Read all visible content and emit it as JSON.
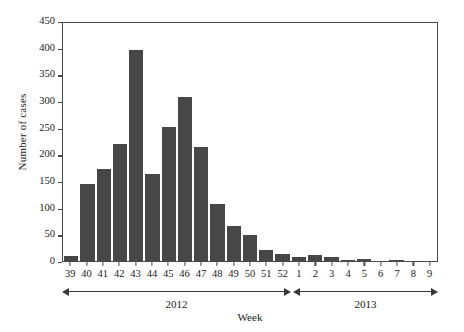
{
  "chart_data": {
    "type": "bar",
    "title": "",
    "xlabel": "Week",
    "ylabel": "Number of cases",
    "ylim": [
      0,
      450
    ],
    "ytick_values": [
      0,
      50,
      100,
      150,
      200,
      250,
      300,
      350,
      400,
      450
    ],
    "ytick_labels": [
      "0",
      "50",
      "100",
      "150",
      "200",
      "250",
      "300",
      "350",
      "400",
      "450"
    ],
    "grid": false,
    "legend": null,
    "bar_color": "#474747",
    "categories": [
      "39",
      "40",
      "41",
      "42",
      "43",
      "44",
      "45",
      "46",
      "47",
      "48",
      "49",
      "50",
      "51",
      "52",
      "1",
      "2",
      "3",
      "4",
      "5",
      "6",
      "7",
      "8",
      "9"
    ],
    "values": [
      9,
      145,
      173,
      220,
      396,
      164,
      252,
      307,
      214,
      107,
      65,
      49,
      21,
      14,
      7,
      12,
      8,
      1,
      3,
      0,
      1,
      0,
      0
    ],
    "annotations": [
      {
        "label": "2012",
        "start_category": "39",
        "end_category": "52"
      },
      {
        "label": "2013",
        "start_category": "1",
        "end_category": "9"
      }
    ]
  },
  "axes": {
    "y_title": "Number of cases",
    "x_title": "Week"
  },
  "spans": {
    "year_2012": "2012",
    "year_2013": "2013"
  }
}
